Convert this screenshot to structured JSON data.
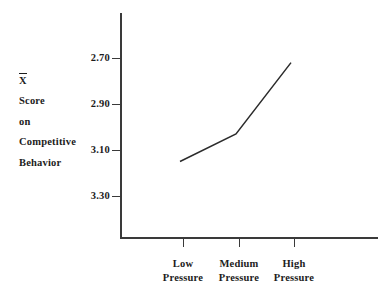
{
  "chart_data": {
    "type": "line",
    "title": "",
    "subtitle": "",
    "xlabel": "",
    "ylabel": "X̄ Score on Competitive Behavior",
    "ylabel_lines": [
      "X̄",
      "Score",
      "on",
      "Competitive",
      "Behavior"
    ],
    "categories": [
      "Low Pressure",
      "Medium Pressure",
      "High Pressure"
    ],
    "category_lines": [
      [
        "Low",
        "Pressure"
      ],
      [
        "Medium",
        "Pressure"
      ],
      [
        "High",
        "Pressure"
      ]
    ],
    "values": [
      3.15,
      3.03,
      2.72
    ],
    "series": [
      {
        "name": "Mean competitive behavior score",
        "values": [
          3.15,
          3.03,
          2.72
        ]
      }
    ],
    "yticks": [
      "2.70",
      "2.90",
      "3.10",
      "3.30"
    ],
    "ytick_values": [
      2.7,
      2.9,
      3.1,
      3.3
    ],
    "ylim": [
      3.3,
      2.7
    ],
    "y_axis_inverted": true,
    "grid": false,
    "legend": "none",
    "line_color": "#2b2b2b",
    "axis_color": "#3a3a3a",
    "text_color": "#1c1c1c",
    "background": "#ffffff",
    "markers": false
  },
  "axis": {
    "y_ticks": [
      {
        "label": "2.70",
        "top": 52
      },
      {
        "label": "2.90",
        "top": 98
      },
      {
        "label": "3.10",
        "top": 144
      },
      {
        "label": "3.30",
        "top": 190
      }
    ],
    "x_ticks": [
      {
        "line1": "Low",
        "line2": "Pressure",
        "center": 183
      },
      {
        "line1": "Medium",
        "line2": "Pressure",
        "center": 239
      },
      {
        "line1": "High",
        "line2": "Pressure",
        "center": 294
      }
    ]
  },
  "ylabel_block": {
    "line0": "X̄",
    "line1": "Score",
    "line2": "on",
    "line3": "Competitive",
    "line4": "Behavior"
  }
}
